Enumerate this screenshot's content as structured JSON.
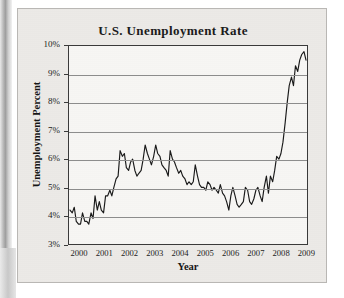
{
  "figure": {
    "caption_area": "printed-figure"
  },
  "chart_data": {
    "type": "line",
    "title": "U.S. Unemployment Rate",
    "xlabel": "Year",
    "ylabel": "Unemployment Percent",
    "grid": true,
    "legend": "none",
    "xlim": [
      2000.0,
      2009.5
    ],
    "ylim": [
      3,
      10
    ],
    "ytick_labels": [
      "10%",
      "9%",
      "8%",
      "7%",
      "6%",
      "5%",
      "4%",
      "3%"
    ],
    "ytick_values": [
      10,
      9,
      8,
      7,
      6,
      5,
      4,
      3
    ],
    "xtick_labels": [
      "2000",
      "2001",
      "2002",
      "2003",
      "2004",
      "2005",
      "2006",
      "2007",
      "2008",
      "2009"
    ],
    "xtick_values": [
      2000,
      2001,
      2002,
      2003,
      2004,
      2005,
      2006,
      2007,
      2008,
      2009
    ],
    "series_name": "Unemployment Percent",
    "series_color": "#1a1a1a",
    "x": [
      2000.04,
      2000.13,
      2000.21,
      2000.29,
      2000.38,
      2000.46,
      2000.54,
      2000.63,
      2000.71,
      2000.79,
      2000.88,
      2000.96,
      2001.04,
      2001.13,
      2001.21,
      2001.29,
      2001.38,
      2001.46,
      2001.54,
      2001.63,
      2001.71,
      2001.79,
      2001.88,
      2001.96,
      2002.04,
      2002.13,
      2002.21,
      2002.29,
      2002.38,
      2002.46,
      2002.54,
      2002.63,
      2002.71,
      2002.79,
      2002.88,
      2002.96,
      2003.04,
      2003.13,
      2003.21,
      2003.29,
      2003.38,
      2003.46,
      2003.54,
      2003.63,
      2003.71,
      2003.79,
      2003.88,
      2003.96,
      2004.04,
      2004.13,
      2004.21,
      2004.29,
      2004.38,
      2004.46,
      2004.54,
      2004.63,
      2004.71,
      2004.79,
      2004.88,
      2004.96,
      2005.04,
      2005.13,
      2005.21,
      2005.29,
      2005.38,
      2005.46,
      2005.54,
      2005.63,
      2005.71,
      2005.79,
      2005.88,
      2005.96,
      2006.04,
      2006.13,
      2006.21,
      2006.29,
      2006.38,
      2006.46,
      2006.54,
      2006.63,
      2006.71,
      2006.79,
      2006.88,
      2006.96,
      2007.04,
      2007.13,
      2007.21,
      2007.29,
      2007.38,
      2007.46,
      2007.54,
      2007.63,
      2007.71,
      2007.79,
      2007.88,
      2007.96,
      2008.04,
      2008.13,
      2008.21,
      2008.29,
      2008.38,
      2008.46,
      2008.54,
      2008.63,
      2008.71,
      2008.79,
      2008.88,
      2008.96,
      2009.04,
      2009.13,
      2009.21,
      2009.29,
      2009.38,
      2009.46
    ],
    "values": [
      4.2,
      4.1,
      4.3,
      3.8,
      3.7,
      3.7,
      4.1,
      3.8,
      3.8,
      3.7,
      4.1,
      3.9,
      4.7,
      4.2,
      4.5,
      4.2,
      4.1,
      4.7,
      4.7,
      4.9,
      4.7,
      5.0,
      5.3,
      5.4,
      6.3,
      6.1,
      6.2,
      5.7,
      5.6,
      5.9,
      6.0,
      5.6,
      5.4,
      5.5,
      5.6,
      6.0,
      6.5,
      6.2,
      6.0,
      5.8,
      6.1,
      6.5,
      6.2,
      6.1,
      5.8,
      5.7,
      5.6,
      5.4,
      6.3,
      6.0,
      5.9,
      5.7,
      5.5,
      5.6,
      5.4,
      5.3,
      5.1,
      5.2,
      5.1,
      5.2,
      5.8,
      5.4,
      5.1,
      5.0,
      5.0,
      4.9,
      5.2,
      5.1,
      4.9,
      5.0,
      4.9,
      4.8,
      5.1,
      4.8,
      4.7,
      4.5,
      4.2,
      4.7,
      5.0,
      4.7,
      4.4,
      4.3,
      4.4,
      4.5,
      5.0,
      4.9,
      4.5,
      4.4,
      4.6,
      4.9,
      5.0,
      4.7,
      4.5,
      5.0,
      5.4,
      4.8,
      5.4,
      5.2,
      5.6,
      6.1,
      6.0,
      6.2,
      6.6,
      7.3,
      8.0,
      8.6,
      8.9,
      8.6,
      9.3,
      9.1,
      9.5,
      9.7,
      9.8,
      9.5
    ],
    "annotations": {
      "peak_value": "9.8%",
      "peak_year": "2009",
      "trough_value": "3.7%",
      "trough_year": "2000"
    }
  }
}
